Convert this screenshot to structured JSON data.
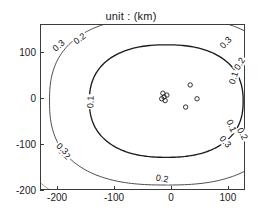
{
  "figure": {
    "title": "unit : (km)",
    "background": "#ffffff",
    "axis_color": "#3b3b3b"
  },
  "axes": {
    "xlim": [
      -230,
      130
    ],
    "ylim": [
      -200,
      160
    ],
    "xticks": [
      -200,
      -100,
      0,
      100
    ],
    "xticklabels": [
      "-200",
      "-100",
      "0",
      "100"
    ],
    "yticks": [
      100,
      0,
      -100,
      -200
    ],
    "yticklabels": [
      "100",
      "0",
      "-100",
      "-200"
    ],
    "grid": false,
    "box": true
  },
  "chart_data": {
    "type": "line",
    "subtype": "contour",
    "title": "unit : (km)",
    "xlabel": "",
    "ylabel": "",
    "xlim": [
      -230,
      130
    ],
    "ylim": [
      -200,
      160
    ],
    "xticks": [
      -200,
      -100,
      0,
      100
    ],
    "yticks": [
      100,
      0,
      -100,
      -200
    ],
    "grid": false,
    "legend": null,
    "levels": [
      0.1,
      0.2,
      0.3
    ],
    "level_colors": [
      "#1b1b1b",
      "#4d4d4d",
      "#9a9a9a"
    ],
    "level_labels": [
      "0.1",
      "0.2",
      "0.3"
    ],
    "contours": [
      {
        "level": 0.1,
        "color": "#1b1b1b",
        "center": [
          -10,
          -5
        ],
        "rx": 135,
        "ry": 122,
        "label_positions": [
          {
            "value": "0.1",
            "x": 110,
            "y": 42,
            "rotation": -72
          },
          {
            "value": "0.1",
            "x": 105,
            "y": -62,
            "rotation": 66
          },
          {
            "value": "0.1",
            "x": -140,
            "y": -8,
            "rotation": -88
          }
        ]
      },
      {
        "level": 0.2,
        "color": "#4d4d4d",
        "center": [
          -10,
          -5
        ],
        "rx": 205,
        "ry": 182,
        "label_positions": [
          {
            "value": "0.2",
            "x": -160,
            "y": 128,
            "rotation": -38
          },
          {
            "value": "0.2",
            "x": 122,
            "y": 74,
            "rotation": -58
          },
          {
            "value": "0.2",
            "x": 124,
            "y": -78,
            "rotation": 62
          },
          {
            "value": "0.2",
            "x": -16,
            "y": -176,
            "rotation": 8
          },
          {
            "value": "0.2",
            "x": -188,
            "y": -122,
            "rotation": 42
          }
        ]
      },
      {
        "level": 0.3,
        "color": "#9a9a9a",
        "center": [
          -10,
          -5
        ],
        "rx": 272,
        "ry": 242,
        "label_positions": [
          {
            "value": "0.3",
            "x": -196,
            "y": 112,
            "rotation": -40
          },
          {
            "value": "0.3",
            "x": 96,
            "y": 118,
            "rotation": -46
          },
          {
            "value": "0.3",
            "x": 94,
            "y": -96,
            "rotation": 50
          },
          {
            "value": "0.3",
            "x": -192,
            "y": -112,
            "rotation": 42
          }
        ]
      }
    ],
    "markers": {
      "symbol": "o",
      "color": "#1b1b1b",
      "points": [
        {
          "x": -16,
          "y": 12
        },
        {
          "x": -14,
          "y": 4
        },
        {
          "x": -12,
          "y": -4
        },
        {
          "x": -18,
          "y": 0
        },
        {
          "x": -9,
          "y": 8
        },
        {
          "x": 32,
          "y": 30
        },
        {
          "x": 44,
          "y": 0
        },
        {
          "x": 24,
          "y": -18
        }
      ]
    }
  }
}
